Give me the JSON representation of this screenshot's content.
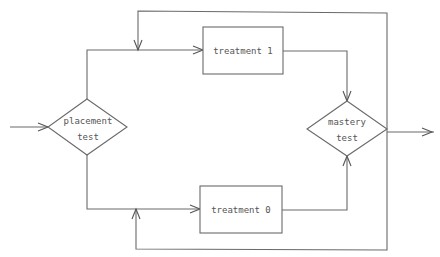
{
  "diagram": {
    "type": "flowchart",
    "nodes": {
      "placement": {
        "shape": "diamond",
        "line1": "placement",
        "line2": "test"
      },
      "treatment1": {
        "shape": "rectangle",
        "label": "treatment 1"
      },
      "treatment0": {
        "shape": "rectangle",
        "label": "treatment 0"
      },
      "mastery": {
        "shape": "diamond",
        "line1": "mastery",
        "line2": "test"
      }
    },
    "edges": [
      {
        "from": "input",
        "to": "placement"
      },
      {
        "from": "placement",
        "to": "treatment1"
      },
      {
        "from": "placement",
        "to": "treatment0"
      },
      {
        "from": "treatment1",
        "to": "mastery"
      },
      {
        "from": "treatment0",
        "to": "mastery"
      },
      {
        "from": "mastery",
        "to": "treatment1",
        "kind": "feedback loop (top)"
      },
      {
        "from": "mastery",
        "to": "treatment0",
        "kind": "feedback loop (bottom)"
      },
      {
        "from": "mastery",
        "to": "output"
      }
    ],
    "colors": {
      "stroke": "#6a6a6a",
      "text": "#555555",
      "background": "#ffffff"
    }
  }
}
